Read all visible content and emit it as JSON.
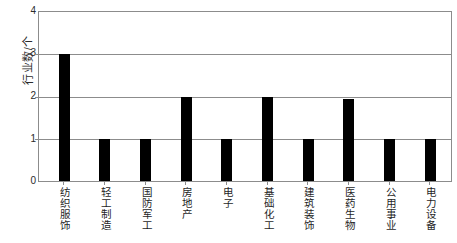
{
  "chart_data": {
    "type": "bar",
    "title": "",
    "xlabel": "",
    "ylabel": "行业数/个",
    "ylim": [
      0,
      4
    ],
    "yticks": [
      "0",
      "1",
      "2",
      "3",
      "4"
    ],
    "grid": true,
    "legend": "none",
    "bar_color": "#000000",
    "axis_color": "#8c8c8c",
    "categories": [
      "纺织服饰",
      "轻工制造",
      "国防军工",
      "房地产",
      "电子",
      "基础化工",
      "建筑装饰",
      "医药生物",
      "公用事业",
      "电力设备"
    ],
    "values": [
      3,
      1,
      1,
      2,
      1,
      2,
      1,
      1.95,
      1,
      1
    ]
  },
  "caption": {
    "partial_text": ""
  }
}
